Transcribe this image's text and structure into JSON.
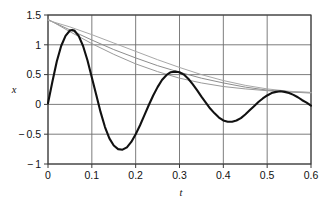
{
  "chart_data": {
    "type": "line",
    "title": "",
    "xlabel": "t",
    "ylabel": "x",
    "xlim": [
      0,
      0.6
    ],
    "ylim": [
      -1,
      1.5
    ],
    "grid": true,
    "legend_position": "none",
    "xticks": [
      "0",
      "0.1",
      "0.2",
      "0.3",
      "0.4",
      "0.5",
      "0.6"
    ],
    "xtick_values": [
      0,
      0.1,
      0.2,
      0.3,
      0.4,
      0.5,
      0.6
    ],
    "yticks": [
      "1.5",
      "1",
      "0.5",
      "0",
      "-0.5",
      "-1"
    ],
    "ytick_values": [
      1.5,
      1,
      0.5,
      0,
      -0.5,
      -1
    ],
    "series": [
      {
        "name": "damped-oscillation",
        "style": "solid-thick-black",
        "color": "#111111",
        "width": 2.1,
        "x": [
          0,
          0.01,
          0.02,
          0.03,
          0.04,
          0.05,
          0.055,
          0.06,
          0.07,
          0.08,
          0.09,
          0.1,
          0.11,
          0.12,
          0.13,
          0.14,
          0.15,
          0.16,
          0.17,
          0.18,
          0.19,
          0.2,
          0.21,
          0.22,
          0.23,
          0.24,
          0.25,
          0.26,
          0.27,
          0.28,
          0.29,
          0.3,
          0.31,
          0.32,
          0.33,
          0.34,
          0.35,
          0.36,
          0.37,
          0.38,
          0.39,
          0.4,
          0.41,
          0.42,
          0.43,
          0.44,
          0.45,
          0.46,
          0.47,
          0.48,
          0.49,
          0.5,
          0.51,
          0.52,
          0.53,
          0.54,
          0.55,
          0.56,
          0.57,
          0.58,
          0.59,
          0.6
        ],
        "y": [
          0.02,
          0.38,
          0.72,
          0.98,
          1.15,
          1.24,
          1.25,
          1.24,
          1.15,
          0.98,
          0.74,
          0.45,
          0.16,
          -0.13,
          -0.38,
          -0.57,
          -0.69,
          -0.75,
          -0.76,
          -0.72,
          -0.63,
          -0.5,
          -0.35,
          -0.18,
          -0.01,
          0.15,
          0.29,
          0.41,
          0.49,
          0.54,
          0.55,
          0.54,
          0.5,
          0.43,
          0.34,
          0.24,
          0.13,
          0.03,
          -0.07,
          -0.15,
          -0.22,
          -0.27,
          -0.29,
          -0.29,
          -0.27,
          -0.23,
          -0.17,
          -0.1,
          -0.03,
          0.04,
          0.1,
          0.15,
          0.19,
          0.21,
          0.22,
          0.21,
          0.19,
          0.16,
          0.12,
          0.07,
          0.03,
          -0.02
        ]
      },
      {
        "name": "envelope-upper-a",
        "style": "solid-thin-gray",
        "color": "#8d8d8d",
        "width": 1.0,
        "x": [
          0,
          0.05,
          0.1,
          0.15,
          0.2,
          0.25,
          0.3,
          0.35,
          0.4,
          0.45,
          0.5,
          0.55,
          0.6
        ],
        "y": [
          1.42,
          1.25,
          1.08,
          0.92,
          0.78,
          0.65,
          0.54,
          0.44,
          0.36,
          0.29,
          0.24,
          0.21,
          0.19
        ]
      },
      {
        "name": "envelope-upper-b",
        "style": "solid-thin-gray",
        "color": "#9a9a9a",
        "width": 1.0,
        "x": [
          0,
          0.05,
          0.1,
          0.15,
          0.2,
          0.25,
          0.3,
          0.35,
          0.4,
          0.45,
          0.5,
          0.55,
          0.6
        ],
        "y": [
          1.43,
          1.22,
          1.02,
          0.84,
          0.68,
          0.55,
          0.44,
          0.36,
          0.3,
          0.26,
          0.23,
          0.21,
          0.2
        ]
      },
      {
        "name": "envelope-upper-c",
        "style": "solid-thin-gray",
        "color": "#a8a8a8",
        "width": 1.0,
        "x": [
          0,
          0.05,
          0.1,
          0.15,
          0.2,
          0.25,
          0.3,
          0.35,
          0.4,
          0.45,
          0.5,
          0.55,
          0.6
        ],
        "y": [
          1.41,
          1.3,
          1.17,
          1.03,
          0.89,
          0.75,
          0.62,
          0.5,
          0.4,
          0.32,
          0.26,
          0.22,
          0.2
        ]
      }
    ],
    "annotations": []
  },
  "colors": {
    "axis": "#3a3a3a",
    "grid": "#6e6e6e",
    "curve": "#111111",
    "envelope": "#9a9a9a",
    "background": "#ffffff",
    "text": "#111111"
  }
}
